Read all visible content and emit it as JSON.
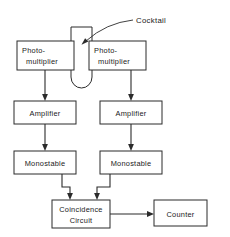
{
  "diagram": {
    "callout": {
      "label": "Cocktail",
      "target": "sample-vial"
    },
    "vial": {
      "name": "sample-vial",
      "shape": "test-tube"
    },
    "blocks": [
      {
        "id": "photomultiplier-left",
        "line1": "Photo-",
        "line2": "multiplier"
      },
      {
        "id": "photomultiplier-right",
        "line1": "Photo-",
        "line2": "multiplier"
      },
      {
        "id": "amplifier-left",
        "line1": "Amplifier"
      },
      {
        "id": "amplifier-right",
        "line1": "Amplifier"
      },
      {
        "id": "monostable-left",
        "line1": "Monostable"
      },
      {
        "id": "monostable-right",
        "line1": "Monostable"
      },
      {
        "id": "coincidence-circuit",
        "line1": "Coincidence",
        "line2": "Circuit"
      },
      {
        "id": "counter",
        "line1": "Counter"
      }
    ],
    "colors": {
      "stroke": "#2b2b2b",
      "text": "#1a1a1a",
      "background": "#ffffff"
    }
  }
}
